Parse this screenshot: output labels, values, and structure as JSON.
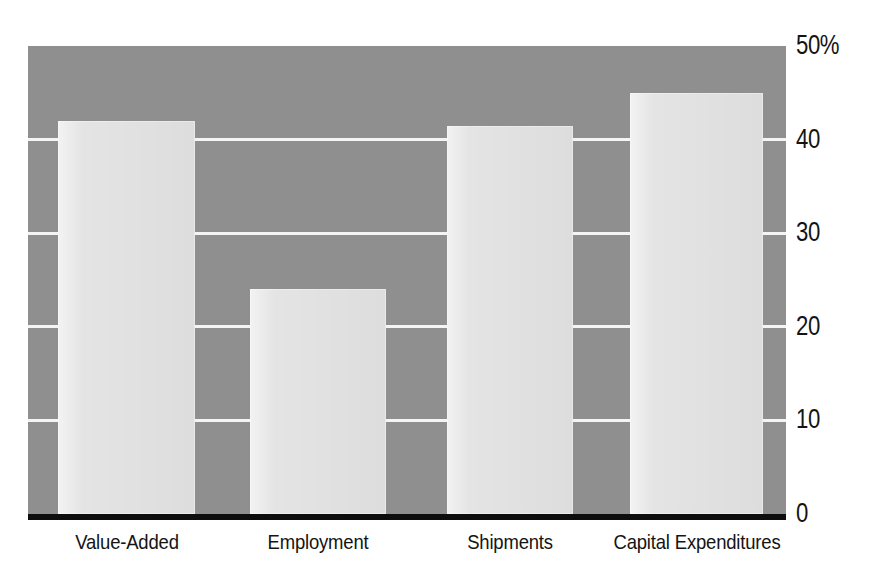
{
  "figure": {
    "title_remnant": "",
    "background_color": "#ffffff",
    "plot_background_color": "#8f8f8f",
    "bar_color": "#e4e4e4",
    "gridline_color": "#f4f4f4",
    "axis_color": "#0d0d0d",
    "text_color": "#141414"
  },
  "chart_data": {
    "type": "bar",
    "title": "",
    "xlabel": "",
    "ylabel": "",
    "categories": [
      "Value-Added",
      "Employment",
      "Shipments",
      "Capital Expenditures"
    ],
    "values": [
      42,
      24,
      41.5,
      45
    ],
    "ylim": [
      0,
      50
    ],
    "yticks": [
      0,
      10,
      20,
      30,
      40,
      50
    ],
    "ytick_labels": [
      "0",
      "10",
      "20",
      "30",
      "40",
      "50%"
    ],
    "grid": true,
    "grid_axis": "y",
    "legend": "none",
    "axis_position": "right",
    "units": "percent"
  }
}
